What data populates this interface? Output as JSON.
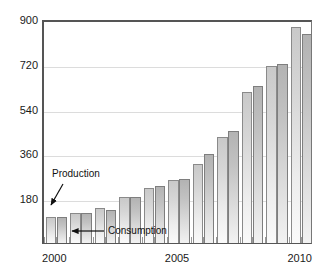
{
  "chart_data": {
    "type": "bar",
    "title": "",
    "subtitle": "",
    "xlabel": "",
    "ylabel": "",
    "categories": [
      "2000",
      "2001",
      "2002",
      "2003",
      "2004",
      "2005",
      "2006",
      "2007",
      "2008",
      "2009",
      "2010"
    ],
    "series": [
      {
        "name": "Production",
        "values": [
          105,
          122,
          140,
          183,
          220,
          253,
          318,
          425,
          605,
          713,
          868
        ]
      },
      {
        "name": "Consumption",
        "values": [
          105,
          120,
          133,
          183,
          228,
          258,
          358,
          450,
          630,
          720,
          840
        ]
      }
    ],
    "ylim": [
      0,
      900
    ],
    "yticks": [
      180,
      360,
      540,
      720,
      900
    ],
    "ytick_labels": [
      "180",
      "360",
      "540",
      "720",
      "900"
    ],
    "xticks": [
      "2000",
      "2005",
      "2010"
    ],
    "grid": true,
    "legend_position": "none",
    "annotations": [
      {
        "label": "Production",
        "target_category": "2000",
        "target_series": "Production"
      },
      {
        "label": "Consumption",
        "target_category": "2000",
        "target_series": "Consumption"
      }
    ],
    "colors": {
      "production_bar": "#d6d6d6",
      "consumption_bar": "#c2c2c2",
      "bar_outline": "#8a8a8a",
      "gridline": "#dcdcdc",
      "axis": "#555555",
      "text": "#1a1a1a",
      "background": "#ffffff"
    }
  },
  "axis": {
    "y_labels": [
      "900",
      "720",
      "540",
      "360",
      "180"
    ],
    "x_labels": [
      "2000",
      "2005",
      "2010"
    ]
  },
  "annotations": {
    "production_label": "Production",
    "consumption_label": "Consumption"
  }
}
